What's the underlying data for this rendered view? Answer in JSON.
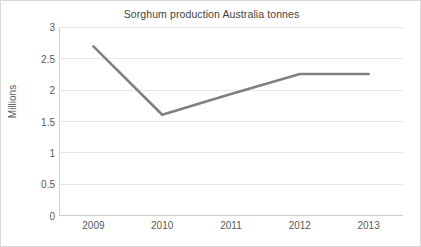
{
  "chart_data": {
    "type": "line",
    "title": "Sorghum production Australia tonnes",
    "xlabel": "",
    "ylabel": "Millions",
    "categories": [
      "2009",
      "2010",
      "2011",
      "2012",
      "2013"
    ],
    "x": [
      2009,
      2010,
      2011,
      2012,
      2013
    ],
    "series": [
      {
        "name": "Sorghum production",
        "values": [
          2.69,
          1.6,
          1.93,
          2.25,
          2.25
        ],
        "color": "#808080"
      }
    ],
    "ylim": [
      0,
      3
    ],
    "yticks": [
      0,
      0.5,
      1,
      1.5,
      2,
      2.5,
      3
    ],
    "ytick_labels": [
      "0",
      "0.5",
      "1",
      "1.5",
      "2",
      "2.5",
      "3"
    ],
    "grid": "horizontal",
    "legend": "none"
  }
}
